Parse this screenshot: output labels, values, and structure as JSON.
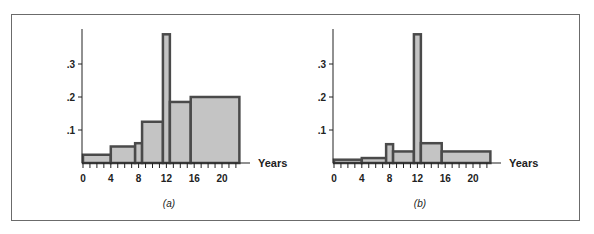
{
  "chart_data": [
    {
      "type": "bar",
      "subtype": "histogram",
      "panel_label": "(a)",
      "xlabel": "Years",
      "ylabel": "",
      "x_ticks": [
        0,
        4,
        8,
        12,
        16,
        20
      ],
      "x_minor_step": 1,
      "x_range": [
        0,
        23
      ],
      "y_ticks": [
        ".1",
        ".2",
        ".3"
      ],
      "y_tick_values": [
        0.1,
        0.2,
        0.3
      ],
      "ylim": [
        0,
        0.4
      ],
      "bins": [
        {
          "x0": 0,
          "x1": 4,
          "value": 0.025
        },
        {
          "x0": 4,
          "x1": 7.5,
          "value": 0.05
        },
        {
          "x0": 7.5,
          "x1": 8.5,
          "value": 0.06
        },
        {
          "x0": 8.5,
          "x1": 11.5,
          "value": 0.125
        },
        {
          "x0": 11.5,
          "x1": 12.5,
          "value": 0.39
        },
        {
          "x0": 12.5,
          "x1": 15.5,
          "value": 0.185
        },
        {
          "x0": 15.5,
          "x1": 22.5,
          "value": 0.2
        }
      ]
    },
    {
      "type": "bar",
      "subtype": "histogram",
      "panel_label": "(b)",
      "xlabel": "Years",
      "ylabel": "",
      "x_ticks": [
        0,
        4,
        8,
        12,
        16,
        20
      ],
      "x_minor_step": 1,
      "x_range": [
        0,
        23
      ],
      "y_ticks": [
        ".1",
        ".2",
        ".3"
      ],
      "y_tick_values": [
        0.1,
        0.2,
        0.3
      ],
      "ylim": [
        0,
        0.4
      ],
      "bins": [
        {
          "x0": 0,
          "x1": 4,
          "value": 0.01
        },
        {
          "x0": 4,
          "x1": 7.5,
          "value": 0.015
        },
        {
          "x0": 7.5,
          "x1": 8.5,
          "value": 0.057
        },
        {
          "x0": 8.5,
          "x1": 11.5,
          "value": 0.035
        },
        {
          "x0": 11.5,
          "x1": 12.5,
          "value": 0.39
        },
        {
          "x0": 12.5,
          "x1": 15.5,
          "value": 0.06
        },
        {
          "x0": 15.5,
          "x1": 22.5,
          "value": 0.035
        }
      ]
    }
  ],
  "style": {
    "bar_fill": "#c4c4c4",
    "bar_stroke": "#4a4a4a",
    "axis_color": "#222222",
    "frame_color": "#6b6b6b"
  },
  "layout": {
    "panels": [
      {
        "origin_x": 83,
        "axis_x": 82
      },
      {
        "origin_x": 334,
        "axis_x": 333
      }
    ],
    "baseline_y": 163,
    "px_per_year": 6.95,
    "px_per_unit_y": 330,
    "axis_top_y": 29,
    "axis_end_x_offset": 168
  }
}
